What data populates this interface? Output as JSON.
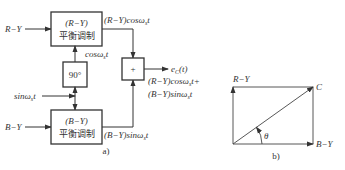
{
  "diagram_a": {
    "caption": "a)",
    "inputs": {
      "r_minus_y": "R−Y",
      "b_minus_y": "B−Y",
      "subcarrier": "sinω",
      "subcarrier_sub": "s",
      "subcarrier_t": "t"
    },
    "top_modulator": {
      "signal": "(R−Y)",
      "label": "平衡调制"
    },
    "bottom_modulator": {
      "signal": "(B−Y)",
      "label": "平衡调制"
    },
    "phase_shifter": {
      "label": "90°"
    },
    "adder": {
      "label": "+"
    },
    "cos_signal": {
      "text": "cosω",
      "sub": "s",
      "t": "t"
    },
    "top_output": {
      "prefix": "(R−Y)cosω",
      "sub": "s",
      "t": "t"
    },
    "bottom_output": {
      "prefix": "(B−Y)sinω",
      "sub": "s",
      "t": "t"
    },
    "result": {
      "name": "e",
      "name_sub": "C",
      "name_arg": "(t)",
      "line1_prefix": "(R−Y)cosω",
      "line1_sub": "s",
      "line1_suffix": "t+",
      "line2_prefix": "(B−Y)sinω",
      "line2_sub": "s",
      "line2_suffix": "t"
    }
  },
  "diagram_b": {
    "caption": "b)",
    "vertical_axis": "R−Y",
    "horizontal_axis": "B−Y",
    "resultant": "C",
    "angle": "θ"
  }
}
